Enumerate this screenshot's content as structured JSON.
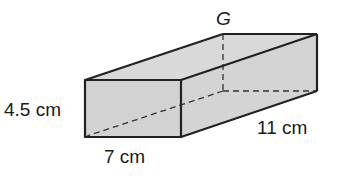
{
  "figure": {
    "type": "rectangular prism",
    "vertex_label": "G",
    "labels": {
      "height": "4.5 cm",
      "width": "7 cm",
      "length": "11 cm"
    },
    "colors": {
      "fill": "#d6d6d6",
      "stroke": "#222222"
    }
  }
}
